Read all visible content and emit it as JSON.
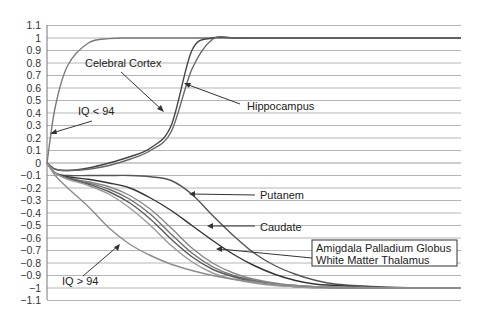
{
  "chart_data": {
    "type": "line",
    "title": "",
    "xlabel": "",
    "ylabel": "",
    "ylim": [
      -1.1,
      1.1
    ],
    "yticks": [
      "1.1",
      "1",
      "0.9",
      "0.8",
      "0.7",
      "0.6",
      "0.5",
      "0.4",
      "0.3",
      "0.2",
      "0.1",
      "0",
      "-0.1",
      "-0.2",
      "-0.3",
      "-0.4",
      "-0.5",
      "-0.6",
      "-0.7",
      "-0.8",
      "-0.9",
      "-1",
      "-1.1"
    ],
    "yticks_values": [
      1.1,
      1,
      0.9,
      0.8,
      0.7,
      0.6,
      0.5,
      0.4,
      0.3,
      0.2,
      0.1,
      0,
      -0.1,
      -0.2,
      -0.3,
      -0.4,
      -0.5,
      -0.6,
      -0.7,
      -0.8,
      -0.9,
      -1,
      -1.1
    ],
    "grid": true,
    "x": [
      0,
      0.02,
      0.05,
      0.1,
      0.15,
      0.2,
      0.25,
      0.3,
      0.35,
      0.4,
      0.45,
      0.5,
      0.55,
      0.6,
      0.65,
      0.7,
      0.8,
      0.9,
      1.0
    ],
    "series": [
      {
        "name": "IQ < 94",
        "color": "#7a7a7a",
        "values": [
          0,
          0.45,
          0.78,
          0.96,
          0.995,
          1,
          1,
          1,
          1,
          1,
          1,
          1,
          1,
          1,
          1,
          1,
          1,
          1,
          1
        ]
      },
      {
        "name": "Celebral Cortex",
        "color": "#444444",
        "values": [
          0,
          -0.05,
          -0.06,
          -0.04,
          0,
          0.05,
          0.12,
          0.3,
          0.9,
          1,
          1,
          1,
          1,
          1,
          1,
          1,
          1,
          1,
          1
        ]
      },
      {
        "name": "Hippocampus",
        "color": "#666666",
        "values": [
          0,
          -0.05,
          -0.06,
          -0.05,
          -0.02,
          0.03,
          0.1,
          0.25,
          0.75,
          0.99,
          1,
          1,
          1,
          1,
          1,
          1,
          1,
          1,
          1
        ]
      },
      {
        "name": "Putanem",
        "color": "#555555",
        "values": [
          0,
          -0.08,
          -0.1,
          -0.1,
          -0.1,
          -0.1,
          -0.11,
          -0.14,
          -0.25,
          -0.42,
          -0.58,
          -0.72,
          -0.82,
          -0.89,
          -0.94,
          -0.97,
          -0.99,
          -1,
          -1
        ]
      },
      {
        "name": "Caudate",
        "color": "#333333",
        "values": [
          0,
          -0.08,
          -0.11,
          -0.13,
          -0.16,
          -0.2,
          -0.28,
          -0.38,
          -0.5,
          -0.62,
          -0.73,
          -0.82,
          -0.89,
          -0.94,
          -0.97,
          -0.98,
          -1,
          -1,
          -1
        ]
      },
      {
        "name": "Amigdala",
        "color": "#888888",
        "values": [
          0,
          -0.08,
          -0.12,
          -0.15,
          -0.19,
          -0.26,
          -0.37,
          -0.52,
          -0.68,
          -0.8,
          -0.88,
          -0.93,
          -0.96,
          -0.98,
          -0.99,
          -1,
          -1,
          -1,
          -1
        ]
      },
      {
        "name": "Palladium Globus",
        "color": "#6f6f6f",
        "values": [
          0,
          -0.08,
          -0.12,
          -0.16,
          -0.21,
          -0.29,
          -0.41,
          -0.57,
          -0.72,
          -0.83,
          -0.9,
          -0.94,
          -0.97,
          -0.98,
          -0.99,
          -1,
          -1,
          -1,
          -1
        ]
      },
      {
        "name": "White Matter",
        "color": "#5a5a5a",
        "values": [
          0,
          -0.08,
          -0.12,
          -0.17,
          -0.23,
          -0.32,
          -0.45,
          -0.61,
          -0.75,
          -0.85,
          -0.91,
          -0.95,
          -0.97,
          -0.99,
          -0.99,
          -1,
          -1,
          -1,
          -1
        ]
      },
      {
        "name": "Thalamus",
        "color": "#999999",
        "values": [
          0,
          -0.08,
          -0.13,
          -0.18,
          -0.25,
          -0.36,
          -0.5,
          -0.66,
          -0.79,
          -0.88,
          -0.93,
          -0.96,
          -0.98,
          -0.99,
          -1,
          -1,
          -1,
          -1,
          -1
        ]
      },
      {
        "name": "IQ > 94",
        "color": "#8c8c8c",
        "values": [
          0,
          -0.1,
          -0.2,
          -0.35,
          -0.52,
          -0.65,
          -0.74,
          -0.81,
          -0.86,
          -0.9,
          -0.93,
          -0.95,
          -0.97,
          -0.98,
          -0.99,
          -0.99,
          -1,
          -1,
          -1
        ]
      }
    ],
    "annotations": [
      {
        "text": "Celebral Cortex",
        "points_to": "Celebral Cortex"
      },
      {
        "text": "Hippocampus",
        "points_to": "Hippocampus"
      },
      {
        "text": "IQ < 94",
        "points_to": "IQ < 94"
      },
      {
        "text": "Putanem",
        "points_to": "Putanem"
      },
      {
        "text": "Caudate",
        "points_to": "Caudate"
      },
      {
        "text": "Amigdala Palladium Globus",
        "points_to": "Amigdala / Palladium Globus"
      },
      {
        "text": "White Matter Thalamus",
        "points_to": "White Matter / Thalamus"
      },
      {
        "text": "IQ > 94",
        "points_to": "IQ > 94"
      }
    ],
    "legend": {
      "position": "boxed annotation, lower right",
      "lines": [
        "Amigdala Palladium Globus",
        "White Matter Thalamus"
      ]
    }
  },
  "labels": {
    "celebral_cortex": "Celebral Cortex",
    "hippocampus": "Hippocampus",
    "iq_low": "IQ < 94",
    "iq_high": "IQ > 94",
    "putanem": "Putanem",
    "caudate": "Caudate",
    "legend_line1": "Amigdala Palladium Globus",
    "legend_line2": "White Matter Thalamus"
  }
}
